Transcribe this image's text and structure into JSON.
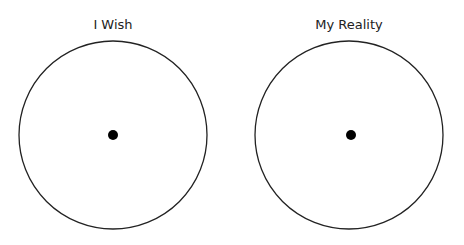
{
  "diagrams": [
    {
      "title": "I Wish",
      "cx": 113,
      "cy": 135,
      "r": 94,
      "dot_x": 113,
      "dot_y": 135,
      "dot_r": 5
    },
    {
      "title": "My Reality",
      "cx": 349,
      "cy": 135,
      "r": 94,
      "dot_x": 351,
      "dot_y": 135,
      "dot_r": 5
    }
  ],
  "colors": {
    "stroke": "#222222",
    "dot": "#000000",
    "background": "#ffffff"
  }
}
